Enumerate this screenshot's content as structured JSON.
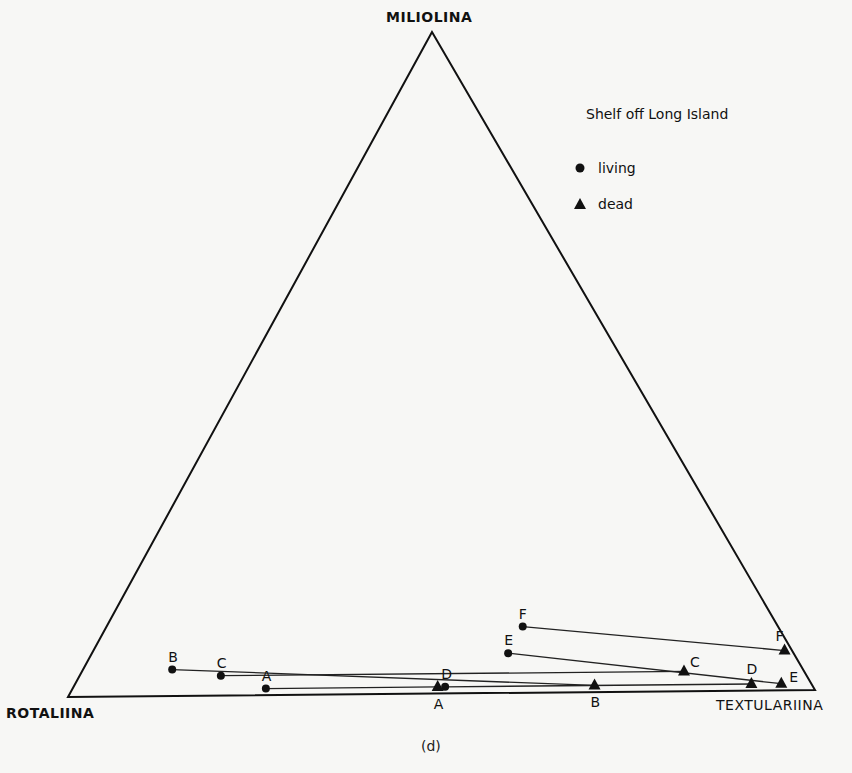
{
  "chart_data": {
    "type": "scatter",
    "subtype": "ternary",
    "title": "Shelf off Long Island",
    "caption": "(d)",
    "vertices": {
      "top": "MILIOLINA",
      "bottom_left": "ROTALIINA",
      "bottom_right": "TEXTULARIINA"
    },
    "legend": [
      {
        "name": "living",
        "marker": "circle"
      },
      {
        "name": "dead",
        "marker": "triangle"
      }
    ],
    "units": "percent (Miliolina, Rotaliina, Textulariina)",
    "series": [
      {
        "name": "living",
        "points": [
          {
            "label": "A",
            "miliolina": 1,
            "rotaliina": 73,
            "textulariina": 26
          },
          {
            "label": "B",
            "miliolina": 4,
            "rotaliina": 84,
            "textulariina": 12
          },
          {
            "label": "C",
            "miliolina": 3,
            "rotaliina": 78,
            "textulariina": 19
          },
          {
            "label": "D",
            "miliolina": 1,
            "rotaliina": 49,
            "textulariina": 50
          },
          {
            "label": "E",
            "miliolina": 6,
            "rotaliina": 38,
            "textulariina": 56
          },
          {
            "label": "F",
            "miliolina": 10,
            "rotaliina": 34,
            "textulariina": 56
          }
        ]
      },
      {
        "name": "dead",
        "points": [
          {
            "label": "A",
            "miliolina": 1,
            "rotaliina": 50,
            "textulariina": 49
          },
          {
            "label": "B",
            "miliolina": 1,
            "rotaliina": 29,
            "textulariina": 70
          },
          {
            "label": "C",
            "miliolina": 3,
            "rotaliina": 16,
            "textulariina": 81
          },
          {
            "label": "D",
            "miliolina": 1,
            "rotaliina": 8,
            "textulariina": 91
          },
          {
            "label": "E",
            "miliolina": 1,
            "rotaliina": 4,
            "textulariina": 95
          },
          {
            "label": "F",
            "miliolina": 6,
            "rotaliina": 1,
            "textulariina": 93
          }
        ]
      }
    ],
    "connections": "each living sample connected by a line to the dead sample of the same letter",
    "grid": false
  },
  "labels": {
    "apex": "MILIOLINA",
    "left": "ROTALIINA",
    "right": "TEXTULARIINA",
    "legend_title": "Shelf off Long Island",
    "legend_living": "living",
    "legend_dead": "dead",
    "caption": "(d)"
  },
  "plot": {
    "stroke": "#111111",
    "background": "#f7f7f5"
  }
}
